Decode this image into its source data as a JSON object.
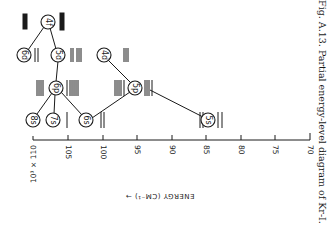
{
  "figure": {
    "caption": "Fig. A.13. Partial energy-level diagram of Kr-I.",
    "axis": {
      "title": "ENERGY (CM⁻¹) →",
      "multiplier": "10³ × 110",
      "ticks": [
        "110",
        "105",
        "100",
        "95",
        "90",
        "85",
        "80",
        "75",
        "70"
      ]
    },
    "levels": [
      {
        "name": "4f",
        "label": "4f"
      },
      {
        "name": "6d",
        "label": "6d"
      },
      {
        "name": "5d",
        "label": "5d"
      },
      {
        "name": "4d",
        "label": "4d"
      },
      {
        "name": "6p",
        "label": "6p"
      },
      {
        "name": "5p",
        "label": "5p"
      },
      {
        "name": "8s",
        "label": "8s"
      },
      {
        "name": "7s",
        "label": "7s"
      },
      {
        "name": "6s",
        "label": "6s"
      },
      {
        "name": "5s",
        "label": "5s"
      }
    ],
    "connections": [
      [
        "4f",
        "6d"
      ],
      [
        "4f",
        "5d"
      ],
      [
        "5d",
        "6p"
      ],
      [
        "6p",
        "8s"
      ],
      [
        "6p",
        "7s"
      ],
      [
        "6p",
        "6s"
      ],
      [
        "6s",
        "5p"
      ],
      [
        "4d",
        "5p"
      ],
      [
        "5p",
        "5s"
      ]
    ],
    "colors": {
      "ink": "#1a1a1a",
      "paper": "#ffffff"
    }
  }
}
